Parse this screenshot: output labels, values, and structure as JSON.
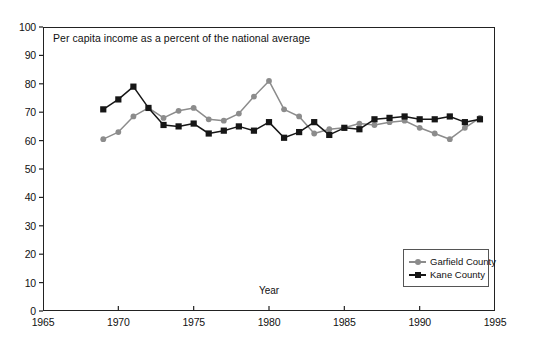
{
  "chart_data": {
    "type": "line",
    "title": "Per capita income as a percent of the national average",
    "xlabel": "Year",
    "ylabel": "",
    "xlim": [
      1965,
      1995
    ],
    "ylim": [
      0,
      100
    ],
    "xticks": [
      1965,
      1970,
      1975,
      1980,
      1985,
      1990,
      1995
    ],
    "yticks": [
      0,
      10,
      20,
      30,
      40,
      50,
      60,
      70,
      80,
      90,
      100
    ],
    "grid": false,
    "legend_position": "bottom-right",
    "x": [
      1969,
      1970,
      1971,
      1972,
      1973,
      1974,
      1975,
      1976,
      1977,
      1978,
      1979,
      1980,
      1981,
      1982,
      1983,
      1984,
      1985,
      1986,
      1987,
      1988,
      1989,
      1990,
      1991,
      1992,
      1993,
      1994
    ],
    "series": [
      {
        "name": "Garfield County",
        "color": "#8c8c8c",
        "marker": "circle",
        "values": [
          60.5,
          63.0,
          68.5,
          71.5,
          68.0,
          70.5,
          71.5,
          67.5,
          67.0,
          69.5,
          75.5,
          81.0,
          71.0,
          68.5,
          62.5,
          64.0,
          64.5,
          66.0,
          65.5,
          66.5,
          67.0,
          64.5,
          62.5,
          60.5,
          64.5,
          68.0
        ]
      },
      {
        "name": "Kane County",
        "color": "#161616",
        "marker": "square",
        "values": [
          71.0,
          74.5,
          79.0,
          71.5,
          65.5,
          65.0,
          66.0,
          62.5,
          63.5,
          65.0,
          63.5,
          66.5,
          61.0,
          63.0,
          66.5,
          62.0,
          64.5,
          64.0,
          67.5,
          68.0,
          68.5,
          67.5,
          67.5,
          68.5,
          66.5,
          67.5
        ]
      }
    ]
  },
  "legend": {
    "items": [
      {
        "label": "Garfield County"
      },
      {
        "label": "Kane County"
      }
    ]
  }
}
